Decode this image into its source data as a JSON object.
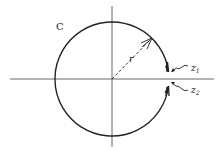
{
  "diagram": {
    "contour_label": "C",
    "radius_label": "r",
    "point_labels": [
      {
        "name": "z",
        "subscript": "1"
      },
      {
        "name": "z",
        "subscript": "2"
      }
    ],
    "colors": {
      "stroke": "#222222",
      "background": "#ffffff"
    }
  }
}
